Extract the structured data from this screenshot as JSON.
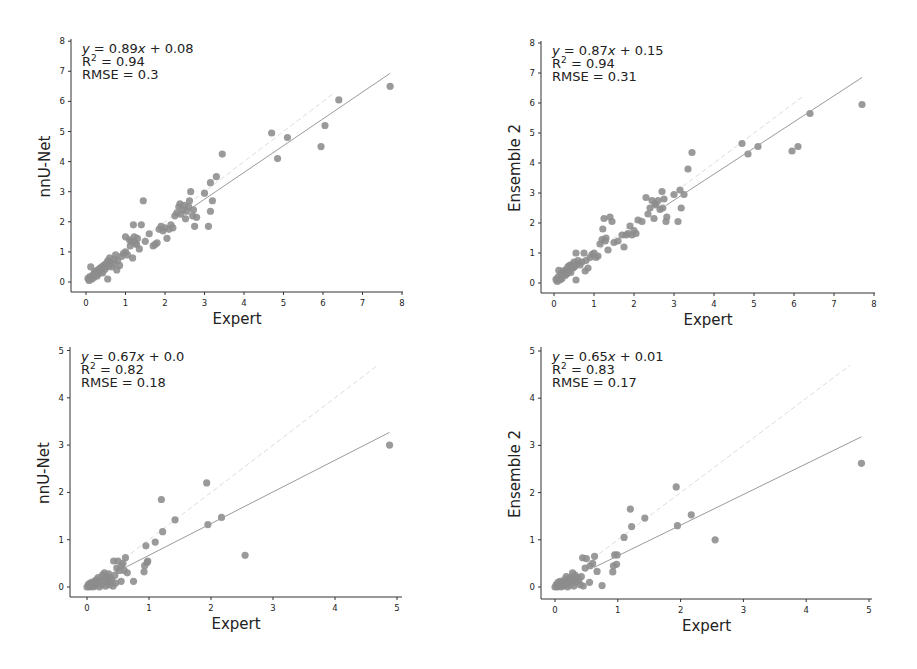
{
  "figure": {
    "background": "#ffffff",
    "point_color": "#8c8c8c",
    "regression_line_color": "#9a9a9a",
    "identity_line_color": "#dcdcdc"
  },
  "chart_data": [
    {
      "id": "top-left",
      "type": "scatter",
      "title": "",
      "xlabel": "Expert",
      "ylabel": "nnU-Net",
      "xlim": [
        0,
        8
      ],
      "ylim": [
        0,
        8
      ],
      "xticks": [
        "0",
        "1",
        "2",
        "3",
        "4",
        "5",
        "6",
        "7",
        "8"
      ],
      "yticks": [
        "0",
        "1",
        "2",
        "3",
        "4",
        "5",
        "6",
        "7",
        "8"
      ],
      "annotation": {
        "equation": "y = 0.89x + 0.08",
        "equation_prefix": "y",
        "equation_body": " = 0.89",
        "equation_x": "x",
        "equation_tail": " + 0.08",
        "r2_label": "R",
        "r2_value": " = 0.94",
        "rmse": "RMSE = 0.3"
      },
      "regression": {
        "slope": 0.89,
        "intercept": 0.08,
        "x_start": 2.7,
        "x_end": 7.7
      },
      "identity_line": {
        "x_start": 0.5,
        "x_end": 6.3
      },
      "grid": false,
      "legend": "none",
      "points": [
        [
          0.05,
          0.12
        ],
        [
          0.08,
          0.05
        ],
        [
          0.1,
          0.18
        ],
        [
          0.12,
          0.5
        ],
        [
          0.15,
          0.1
        ],
        [
          0.18,
          0.25
        ],
        [
          0.2,
          0.15
        ],
        [
          0.22,
          0.35
        ],
        [
          0.25,
          0.3
        ],
        [
          0.28,
          0.2
        ],
        [
          0.3,
          0.4
        ],
        [
          0.32,
          0.28
        ],
        [
          0.35,
          0.45
        ],
        [
          0.38,
          0.35
        ],
        [
          0.4,
          0.5
        ],
        [
          0.42,
          0.3
        ],
        [
          0.45,
          0.55
        ],
        [
          0.48,
          0.42
        ],
        [
          0.5,
          0.6
        ],
        [
          0.52,
          0.5
        ],
        [
          0.55,
          0.1
        ],
        [
          0.55,
          0.7
        ],
        [
          0.58,
          0.55
        ],
        [
          0.6,
          0.8
        ],
        [
          0.62,
          0.65
        ],
        [
          0.65,
          0.5
        ],
        [
          0.7,
          0.6
        ],
        [
          0.72,
          0.75
        ],
        [
          0.75,
          0.9
        ],
        [
          0.78,
          0.4
        ],
        [
          0.8,
          0.7
        ],
        [
          0.85,
          0.55
        ],
        [
          0.9,
          0.85
        ],
        [
          0.95,
          0.95
        ],
        [
          1.0,
          1.0
        ],
        [
          1.0,
          1.5
        ],
        [
          1.05,
          0.9
        ],
        [
          1.1,
          1.4
        ],
        [
          1.12,
          1.2
        ],
        [
          1.15,
          1.35
        ],
        [
          1.18,
          0.8
        ],
        [
          1.2,
          1.9
        ],
        [
          1.22,
          1.5
        ],
        [
          1.25,
          1.3
        ],
        [
          1.28,
          1.25
        ],
        [
          1.3,
          1.45
        ],
        [
          1.35,
          1.1
        ],
        [
          1.4,
          1.9
        ],
        [
          1.45,
          2.7
        ],
        [
          1.5,
          1.35
        ],
        [
          1.6,
          1.6
        ],
        [
          1.7,
          1.2
        ],
        [
          1.75,
          1.25
        ],
        [
          1.8,
          1.3
        ],
        [
          1.85,
          1.75
        ],
        [
          1.9,
          1.85
        ],
        [
          1.95,
          1.7
        ],
        [
          2.0,
          1.8
        ],
        [
          2.05,
          1.45
        ],
        [
          2.1,
          1.75
        ],
        [
          2.15,
          1.9
        ],
        [
          2.2,
          1.8
        ],
        [
          2.25,
          2.2
        ],
        [
          2.3,
          2.3
        ],
        [
          2.35,
          2.5
        ],
        [
          2.38,
          2.6
        ],
        [
          2.4,
          2.25
        ],
        [
          2.45,
          2.4
        ],
        [
          2.5,
          2.55
        ],
        [
          2.52,
          2.1
        ],
        [
          2.55,
          2.35
        ],
        [
          2.6,
          2.5
        ],
        [
          2.62,
          2.7
        ],
        [
          2.65,
          3.0
        ],
        [
          2.7,
          2.2
        ],
        [
          2.72,
          2.4
        ],
        [
          2.75,
          1.85
        ],
        [
          2.8,
          2.15
        ],
        [
          3.0,
          2.95
        ],
        [
          3.1,
          1.85
        ],
        [
          3.15,
          3.3
        ],
        [
          3.15,
          2.35
        ],
        [
          3.2,
          2.7
        ],
        [
          3.3,
          3.5
        ],
        [
          3.45,
          4.25
        ],
        [
          4.7,
          4.95
        ],
        [
          4.85,
          4.1
        ],
        [
          5.1,
          4.8
        ],
        [
          5.95,
          4.5
        ],
        [
          6.05,
          5.2
        ],
        [
          6.4,
          6.05
        ],
        [
          7.7,
          6.5
        ]
      ]
    },
    {
      "id": "top-right",
      "type": "scatter",
      "title": "",
      "xlabel": "Expert",
      "ylabel": "Ensemble 2",
      "xlim": [
        0,
        8
      ],
      "ylim": [
        0,
        8
      ],
      "xticks": [
        "0",
        "1",
        "2",
        "3",
        "4",
        "5",
        "6",
        "7",
        "8"
      ],
      "yticks": [
        "0",
        "1",
        "2",
        "3",
        "4",
        "5",
        "6",
        "7",
        "8"
      ],
      "annotation": {
        "equation": "y = 0.87x + 0.15",
        "equation_prefix": "y",
        "equation_body": " = 0.87",
        "equation_x": "x",
        "equation_tail": " + 0.15",
        "r2_label": "R",
        "r2_value": " = 0.94",
        "rmse": "RMSE = 0.31"
      },
      "regression": {
        "slope": 0.87,
        "intercept": 0.15,
        "x_start": 2.8,
        "x_end": 7.7
      },
      "identity_line": {
        "x_start": 0.5,
        "x_end": 6.2
      },
      "grid": false,
      "legend": "none",
      "points": [
        [
          0.05,
          0.12
        ],
        [
          0.08,
          0.05
        ],
        [
          0.1,
          0.2
        ],
        [
          0.12,
          0.42
        ],
        [
          0.15,
          0.1
        ],
        [
          0.18,
          0.3
        ],
        [
          0.2,
          0.15
        ],
        [
          0.22,
          0.4
        ],
        [
          0.25,
          0.35
        ],
        [
          0.28,
          0.25
        ],
        [
          0.3,
          0.45
        ],
        [
          0.32,
          0.3
        ],
        [
          0.35,
          0.55
        ],
        [
          0.38,
          0.4
        ],
        [
          0.4,
          0.6
        ],
        [
          0.42,
          0.35
        ],
        [
          0.45,
          0.6
        ],
        [
          0.48,
          0.5
        ],
        [
          0.5,
          0.7
        ],
        [
          0.52,
          0.55
        ],
        [
          0.55,
          0.1
        ],
        [
          0.55,
          1.0
        ],
        [
          0.58,
          0.65
        ],
        [
          0.6,
          0.75
        ],
        [
          0.65,
          0.6
        ],
        [
          0.7,
          0.7
        ],
        [
          0.75,
          1.0
        ],
        [
          0.78,
          0.4
        ],
        [
          0.8,
          0.75
        ],
        [
          0.85,
          0.5
        ],
        [
          0.9,
          0.85
        ],
        [
          0.95,
          0.95
        ],
        [
          1.0,
          1.0
        ],
        [
          1.05,
          0.85
        ],
        [
          1.1,
          0.9
        ],
        [
          1.15,
          1.3
        ],
        [
          1.2,
          1.45
        ],
        [
          1.22,
          1.8
        ],
        [
          1.25,
          2.15
        ],
        [
          1.28,
          1.4
        ],
        [
          1.3,
          1.5
        ],
        [
          1.35,
          1.1
        ],
        [
          1.4,
          2.2
        ],
        [
          1.45,
          2.05
        ],
        [
          1.5,
          1.35
        ],
        [
          1.6,
          1.4
        ],
        [
          1.7,
          1.6
        ],
        [
          1.75,
          1.2
        ],
        [
          1.8,
          1.6
        ],
        [
          1.85,
          1.65
        ],
        [
          1.9,
          1.9
        ],
        [
          1.95,
          1.6
        ],
        [
          2.0,
          1.75
        ],
        [
          2.05,
          1.65
        ],
        [
          2.1,
          2.1
        ],
        [
          2.2,
          2.05
        ],
        [
          2.3,
          2.85
        ],
        [
          2.35,
          2.3
        ],
        [
          2.4,
          2.5
        ],
        [
          2.45,
          2.75
        ],
        [
          2.5,
          2.15
        ],
        [
          2.52,
          2.65
        ],
        [
          2.55,
          2.6
        ],
        [
          2.6,
          2.75
        ],
        [
          2.65,
          2.45
        ],
        [
          2.7,
          3.05
        ],
        [
          2.72,
          2.5
        ],
        [
          2.75,
          2.8
        ],
        [
          2.8,
          2.05
        ],
        [
          2.82,
          2.2
        ],
        [
          3.0,
          2.95
        ],
        [
          3.1,
          2.05
        ],
        [
          3.15,
          3.1
        ],
        [
          3.18,
          2.5
        ],
        [
          3.25,
          2.95
        ],
        [
          3.35,
          3.8
        ],
        [
          3.45,
          4.35
        ],
        [
          4.7,
          4.65
        ],
        [
          4.85,
          4.3
        ],
        [
          5.1,
          4.55
        ],
        [
          5.95,
          4.4
        ],
        [
          6.1,
          4.55
        ],
        [
          6.4,
          5.65
        ],
        [
          7.7,
          5.95
        ]
      ]
    },
    {
      "id": "bottom-left",
      "type": "scatter",
      "title": "",
      "xlabel": "Expert",
      "ylabel": "nnU-Net",
      "xlim": [
        0,
        5
      ],
      "ylim": [
        0,
        5
      ],
      "xticks": [
        "0",
        "1",
        "2",
        "3",
        "4",
        "5"
      ],
      "yticks": [
        "0",
        "1",
        "2",
        "3",
        "4",
        "5"
      ],
      "annotation": {
        "equation": "y = 0.67x + 0.0",
        "equation_prefix": "y",
        "equation_body": " = 0.67",
        "equation_x": "x",
        "equation_tail": " + 0.0",
        "r2_label": "R",
        "r2_value": " = 0.82",
        "rmse": "RMSE = 0.18"
      },
      "regression": {
        "slope": 0.67,
        "intercept": 0.0,
        "x_start": 0.62,
        "x_end": 4.88
      },
      "identity_line": {
        "x_start": 0.6,
        "x_end": 4.7
      },
      "grid": false,
      "legend": "none",
      "points": [
        [
          0.0,
          0.0
        ],
        [
          0.02,
          0.05
        ],
        [
          0.04,
          0.0
        ],
        [
          0.05,
          0.08
        ],
        [
          0.06,
          0.02
        ],
        [
          0.08,
          0.1
        ],
        [
          0.1,
          0.05
        ],
        [
          0.1,
          0.0
        ],
        [
          0.12,
          0.12
        ],
        [
          0.14,
          0.03
        ],
        [
          0.15,
          0.15
        ],
        [
          0.16,
          0.06
        ],
        [
          0.18,
          0.2
        ],
        [
          0.2,
          0.1
        ],
        [
          0.2,
          0.0
        ],
        [
          0.22,
          0.15
        ],
        [
          0.24,
          0.05
        ],
        [
          0.25,
          0.25
        ],
        [
          0.27,
          0.12
        ],
        [
          0.28,
          0.3
        ],
        [
          0.3,
          0.18
        ],
        [
          0.3,
          0.02
        ],
        [
          0.32,
          0.22
        ],
        [
          0.34,
          0.1
        ],
        [
          0.35,
          0.28
        ],
        [
          0.36,
          0.05
        ],
        [
          0.38,
          0.2
        ],
        [
          0.4,
          0.15
        ],
        [
          0.42,
          0.02
        ],
        [
          0.43,
          0.55
        ],
        [
          0.45,
          0.25
        ],
        [
          0.46,
          0.08
        ],
        [
          0.48,
          0.4
        ],
        [
          0.5,
          0.55
        ],
        [
          0.52,
          0.35
        ],
        [
          0.55,
          0.12
        ],
        [
          0.56,
          0.45
        ],
        [
          0.58,
          0.5
        ],
        [
          0.6,
          0.35
        ],
        [
          0.62,
          0.62
        ],
        [
          0.65,
          0.3
        ],
        [
          0.75,
          0.12
        ],
        [
          0.92,
          0.32
        ],
        [
          0.93,
          0.45
        ],
        [
          0.95,
          0.87
        ],
        [
          0.97,
          0.52
        ],
        [
          0.98,
          0.55
        ],
        [
          1.1,
          0.95
        ],
        [
          1.2,
          1.85
        ],
        [
          1.22,
          1.17
        ],
        [
          1.42,
          1.42
        ],
        [
          1.93,
          2.2
        ],
        [
          1.95,
          1.32
        ],
        [
          2.17,
          1.47
        ],
        [
          2.55,
          0.67
        ],
        [
          4.88,
          3.0
        ]
      ]
    },
    {
      "id": "bottom-right",
      "type": "scatter",
      "title": "",
      "xlabel": "Expert",
      "ylabel": "Ensemble 2",
      "xlim": [
        0,
        5
      ],
      "ylim": [
        0,
        5
      ],
      "xticks": [
        "0",
        "1",
        "2",
        "3",
        "4",
        "5"
      ],
      "yticks": [
        "0",
        "1",
        "2",
        "3",
        "4",
        "5"
      ],
      "annotation": {
        "equation": "y = 0.65x + 0.01",
        "equation_prefix": "y",
        "equation_body": " = 0.65",
        "equation_x": "x",
        "equation_tail": " + 0.01",
        "r2_label": "R",
        "r2_value": " = 0.83",
        "rmse": "RMSE = 0.17"
      },
      "regression": {
        "slope": 0.65,
        "intercept": 0.01,
        "x_start": 0.62,
        "x_end": 4.88
      },
      "identity_line": {
        "x_start": 0.6,
        "x_end": 4.7
      },
      "grid": false,
      "legend": "none",
      "points": [
        [
          0.0,
          0.0
        ],
        [
          0.02,
          0.05
        ],
        [
          0.04,
          0.0
        ],
        [
          0.05,
          0.1
        ],
        [
          0.06,
          0.02
        ],
        [
          0.08,
          0.12
        ],
        [
          0.1,
          0.05
        ],
        [
          0.1,
          0.0
        ],
        [
          0.12,
          0.1
        ],
        [
          0.14,
          0.03
        ],
        [
          0.15,
          0.15
        ],
        [
          0.16,
          0.06
        ],
        [
          0.18,
          0.22
        ],
        [
          0.2,
          0.1
        ],
        [
          0.2,
          0.0
        ],
        [
          0.22,
          0.18
        ],
        [
          0.24,
          0.05
        ],
        [
          0.25,
          0.2
        ],
        [
          0.27,
          0.12
        ],
        [
          0.28,
          0.3
        ],
        [
          0.3,
          0.18
        ],
        [
          0.3,
          0.02
        ],
        [
          0.32,
          0.25
        ],
        [
          0.34,
          0.1
        ],
        [
          0.36,
          0.2
        ],
        [
          0.38,
          0.15
        ],
        [
          0.4,
          0.05
        ],
        [
          0.42,
          0.22
        ],
        [
          0.44,
          0.62
        ],
        [
          0.45,
          0.02
        ],
        [
          0.48,
          0.4
        ],
        [
          0.5,
          0.6
        ],
        [
          0.55,
          0.1
        ],
        [
          0.56,
          0.45
        ],
        [
          0.6,
          0.5
        ],
        [
          0.63,
          0.65
        ],
        [
          0.67,
          0.33
        ],
        [
          0.75,
          0.03
        ],
        [
          0.92,
          0.32
        ],
        [
          0.93,
          0.45
        ],
        [
          0.95,
          0.68
        ],
        [
          0.98,
          0.48
        ],
        [
          0.99,
          0.68
        ],
        [
          1.1,
          1.05
        ],
        [
          1.2,
          1.65
        ],
        [
          1.22,
          1.28
        ],
        [
          1.43,
          1.46
        ],
        [
          1.93,
          2.12
        ],
        [
          1.95,
          1.3
        ],
        [
          2.17,
          1.53
        ],
        [
          2.55,
          1.0
        ],
        [
          4.88,
          2.62
        ]
      ]
    }
  ]
}
